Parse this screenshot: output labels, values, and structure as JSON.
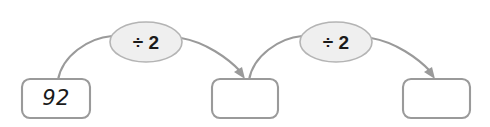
{
  "diagram": {
    "type": "function-machine-flow",
    "title": "",
    "colors": {
      "box_stroke": "#9a9a9a",
      "box_fill": "#ffffff",
      "ellipse_fill": "#efefef",
      "ellipse_stroke": "#b4b4b4",
      "arrow": "#9a9a9a",
      "text": "#1a1a1a",
      "background": "#ffffff"
    },
    "boxes": [
      {
        "id": "box-1",
        "value": "92",
        "empty": false
      },
      {
        "id": "box-2",
        "value": "",
        "empty": true
      },
      {
        "id": "box-3",
        "value": "",
        "empty": true
      }
    ],
    "operations": [
      {
        "id": "op-1",
        "label": "÷ 2"
      },
      {
        "id": "op-2",
        "label": "÷ 2"
      }
    ]
  }
}
